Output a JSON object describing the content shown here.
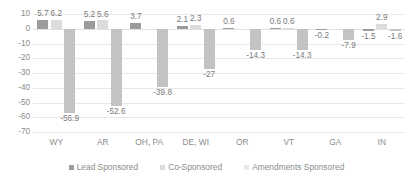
{
  "chart_data": {
    "type": "bar",
    "title": "",
    "xlabel": "",
    "ylabel": "",
    "ylim": [
      -70,
      10
    ],
    "yticks": [
      10,
      0,
      -10,
      -20,
      -30,
      -40,
      -50,
      -60,
      -70
    ],
    "ytick_labels": [
      "10",
      "0",
      "-10",
      "-20",
      "-30",
      "-40",
      "-50",
      "-60",
      "-70"
    ],
    "grid": true,
    "legend_position": "bottom",
    "categories": [
      "WY",
      "AR",
      "OH, PA",
      "DE, WI",
      "OR",
      "VT",
      "GA",
      "IN"
    ],
    "series": [
      {
        "name": "Lead Sponsored",
        "color": "#9c9c9c",
        "values": [
          5.7,
          5.2,
          3.7,
          2.1,
          0.6,
          0.6,
          -0.2,
          -1.5
        ],
        "labels": [
          "5.7",
          "5.2",
          "3.7",
          "2.1",
          "0.6",
          "0.6",
          "-0.2",
          "-1.5"
        ]
      },
      {
        "name": "Co-Sponsored",
        "color": "#dcdcdc",
        "values": [
          6.2,
          5.6,
          null,
          2.3,
          null,
          0.6,
          null,
          2.9
        ],
        "labels": [
          "6.2",
          "5.6",
          "",
          "2.3",
          "",
          "0.6",
          "",
          "2.9"
        ]
      },
      {
        "name": "Amendments Sponsored",
        "color": "#c3c3c3",
        "values": [
          -56.9,
          -52.6,
          -39.8,
          -27,
          -14.3,
          -14.3,
          -7.9,
          -1.6
        ],
        "labels": [
          "-56.9",
          "-52.6",
          "-39.8",
          "-27",
          "-14.3",
          "-14.3",
          "-7.9",
          "-1.6"
        ]
      }
    ]
  },
  "legend": {
    "items": [
      {
        "label": "Lead Sponsored"
      },
      {
        "label": "Co-Sponsored"
      },
      {
        "label": "Amendments Sponsored"
      }
    ]
  }
}
